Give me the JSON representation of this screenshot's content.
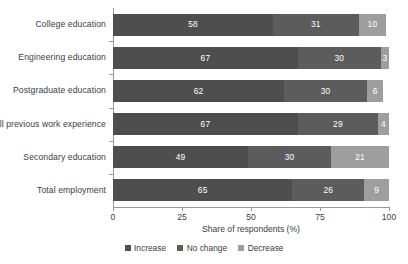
{
  "chart_data": {
    "type": "bar",
    "orientation": "horizontal",
    "stacked": true,
    "title": "",
    "xlabel": "Share of respondents (%)",
    "ylabel": "",
    "xlim": [
      0,
      100
    ],
    "xticks": [
      0,
      25,
      50,
      75,
      100
    ],
    "xtick_labels": [
      "0",
      "25",
      "50",
      "75",
      "100"
    ],
    "grid": false,
    "legend_position": "bottom-center",
    "categories": [
      "College education",
      "Engineering education",
      "Postgraduate education",
      "All previous work experience",
      "Secondary education",
      "Total employment"
    ],
    "series": [
      {
        "name": "Increase",
        "color": "#4e4e4e",
        "values": [
          58,
          67,
          62,
          67,
          49,
          65
        ]
      },
      {
        "name": "No change",
        "color": "#5c5c5c",
        "values": [
          31,
          30,
          30,
          29,
          30,
          26
        ]
      },
      {
        "name": "Decrease",
        "color": "#9e9e9e",
        "values": [
          10,
          3,
          6,
          4,
          21,
          9
        ]
      }
    ]
  }
}
